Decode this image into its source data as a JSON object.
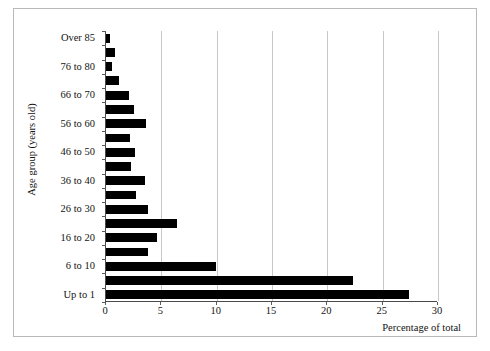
{
  "chart_data": {
    "type": "bar",
    "orientation": "horizontal",
    "title": "",
    "xlabel": "Percentage of total",
    "ylabel": "Age group (years old)",
    "xlim": [
      0,
      30
    ],
    "xticks": [
      0,
      5,
      10,
      15,
      20,
      25,
      30
    ],
    "xtick_labels": [
      "0",
      "5",
      "10",
      "15",
      "20",
      "25",
      "30"
    ],
    "grid": "vertical",
    "legend": null,
    "bar_color": "#000000",
    "grid_color": "#c8c8c8",
    "axis_color": "#4a4a4a",
    "categories": [
      "Up to 1",
      "2 to 5",
      "6 to 10",
      "11 to 15",
      "16 to 20",
      "21 to 25",
      "26 to 30",
      "31 to 35",
      "36 to 40",
      "41 to 45",
      "46 to 50",
      "51 to 55",
      "56 to 60",
      "61 to 65",
      "66 to 70",
      "71 to 75",
      "76 to 80",
      "81 to 85",
      "Over 85"
    ],
    "values": [
      27.4,
      22.3,
      9.9,
      3.8,
      4.6,
      6.4,
      3.8,
      2.7,
      3.5,
      2.3,
      2.6,
      2.2,
      3.6,
      2.5,
      2.1,
      1.15,
      0.55,
      0.85,
      0.35
    ],
    "visible_ytick_labels": [
      "Over 85",
      "76 to 80",
      "66 to 70",
      "56 to 60",
      "46 to 50",
      "36 to 40",
      "26 to 30",
      "16 to 20",
      "6 to 10",
      "Up to 1"
    ]
  }
}
